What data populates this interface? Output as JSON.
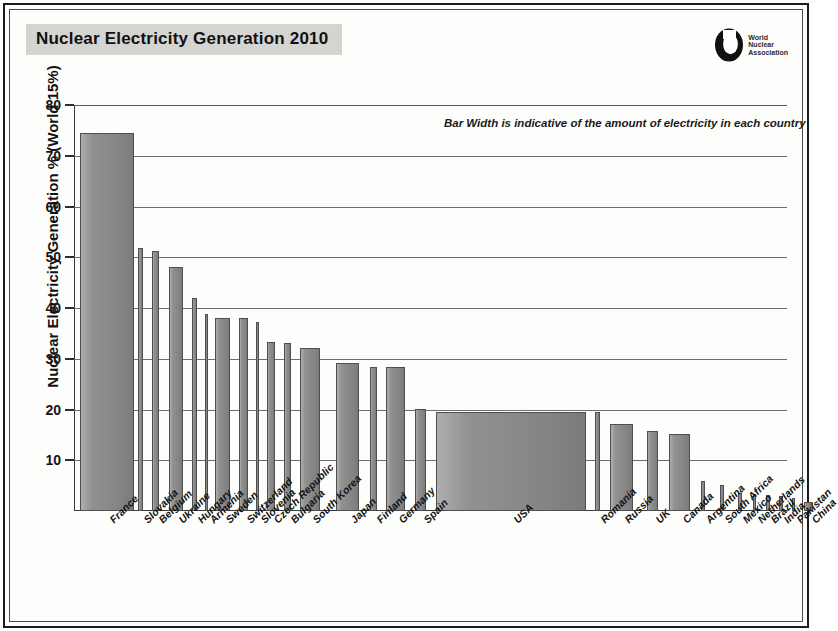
{
  "header": {
    "title": "Nuclear Electricity Generation 2010",
    "logo": {
      "name": "world-nuclear-association-logo",
      "line1": "World",
      "line2": "Nuclear",
      "line3": "Association"
    }
  },
  "chart_data": {
    "type": "bar",
    "title": "Nuclear Electricity Generation 2010",
    "xlabel": "",
    "ylabel": "Nuclear Electricity Generation % (World 15%)",
    "ylim": [
      0,
      80
    ],
    "yticks": [
      10,
      20,
      30,
      40,
      50,
      60,
      70,
      80
    ],
    "grid": true,
    "legend": null,
    "annotation": "Bar Width is indicative of the amount of electricity in each country",
    "note": "Bar width encodes total electricity generated in each country; bar height is nuclear share of electricity (%).",
    "categories": [
      "France",
      "Slovakia",
      "Belgium",
      "Ukraine",
      "Hungary",
      "Armenia",
      "Sweden",
      "Switzerland",
      "Slovenia",
      "Czech Republic",
      "Bulgaria",
      "South Korea",
      "Japan",
      "Finland",
      "Germany",
      "Spain",
      "USA",
      "Romania",
      "Russia",
      "UK",
      "Canada",
      "Argentina",
      "South Africa",
      "Mexico",
      "Netherlands",
      "Brazil",
      "India",
      "Pakistan",
      "China"
    ],
    "values": [
      74.5,
      51.8,
      51.2,
      48.1,
      42.0,
      38.8,
      38.1,
      38.0,
      37.3,
      33.3,
      33.1,
      32.2,
      29.2,
      28.4,
      28.4,
      20.1,
      19.6,
      19.5,
      17.1,
      15.7,
      15.1,
      5.9,
      5.2,
      3.6,
      3.4,
      3.1,
      2.9,
      2.6,
      1.8
    ],
    "bar_widths_px": [
      54,
      5,
      7,
      14,
      5,
      3,
      15,
      9,
      3,
      8,
      7,
      20,
      23,
      7,
      19,
      11,
      150,
      5,
      23,
      11,
      21,
      4,
      4,
      4,
      3,
      4,
      4,
      3,
      9
    ],
    "bar_left_px": [
      6,
      64,
      78,
      95,
      118,
      131,
      141,
      165,
      182,
      193,
      210,
      226,
      262,
      296,
      312,
      341,
      362,
      521,
      536,
      573,
      595,
      627,
      646,
      664,
      679,
      692,
      705,
      718,
      730
    ]
  },
  "axis_labels": {
    "y_title": "Nuclear Electricity Generation % (World 15%)",
    "ticks": [
      "80",
      "70",
      "60",
      "50",
      "40",
      "30",
      "20",
      "10"
    ]
  }
}
